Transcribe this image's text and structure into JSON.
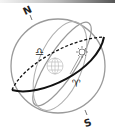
{
  "diagram": {
    "type": "celestial-sphere",
    "labels": {
      "north": "N",
      "south": "S",
      "libra_symbol": "♎",
      "aries_symbol": "♈"
    },
    "elements": [
      "celestial-sphere",
      "ecliptic",
      "celestial-equator",
      "meridian",
      "earth-globe",
      "sun"
    ],
    "colors": {
      "ecliptic": "#111111",
      "circles": "#9a9a9a",
      "globe": "#b5b5b5",
      "top_bar_end": "#555555"
    }
  }
}
